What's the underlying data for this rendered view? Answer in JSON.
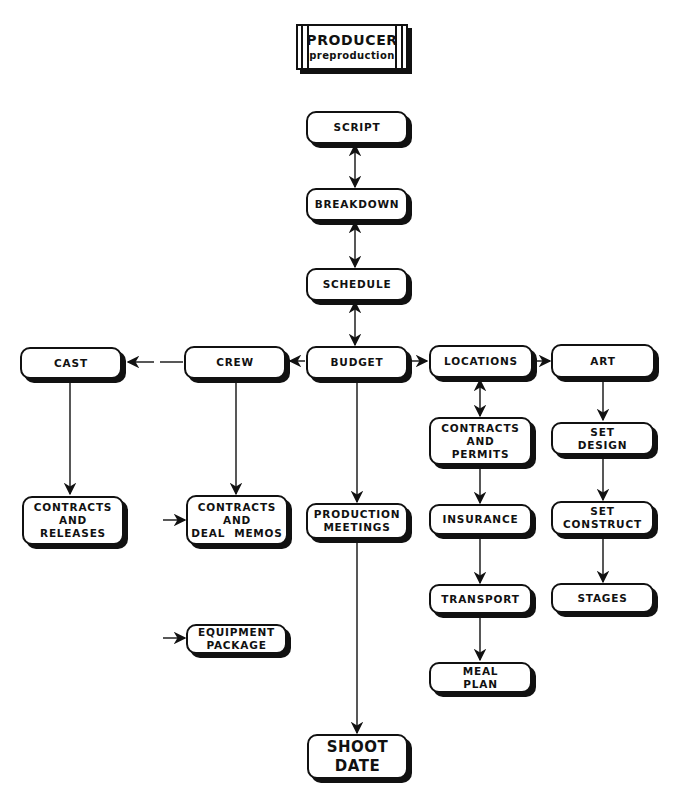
{
  "title": {
    "main": "PRODUCER",
    "sub": "preproduction"
  },
  "nodes": {
    "script": "SCRIPT",
    "breakdown": "BREAKDOWN",
    "schedule": "SCHEDULE",
    "budget": "BUDGET",
    "cast": "CAST",
    "crew": "CREW",
    "locations": "LOCATIONS",
    "art": "ART",
    "cast_contracts": [
      "CONTRACTS",
      "AND",
      "RELEASES"
    ],
    "crew_contracts": [
      "CONTRACTS",
      "AND",
      "DEAL  MEMOS"
    ],
    "equipment": [
      "EQUIPMENT",
      "PACKAGE"
    ],
    "production_meetings": [
      "PRODUCTION",
      "MEETINGS"
    ],
    "shoot_date": [
      "SHOOT",
      "DATE"
    ],
    "contracts_permits": [
      "CONTRACTS",
      "AND",
      "PERMITS"
    ],
    "insurance": "INSURANCE",
    "transport": "TRANSPORT",
    "meal_plan": [
      "MEAL",
      "PLAN"
    ],
    "set_design": [
      "SET",
      "DESIGN"
    ],
    "set_construct": [
      "SET",
      "CONSTRUCT"
    ],
    "stages": "STAGES"
  },
  "connections": [
    {
      "from": "script",
      "to": "breakdown",
      "type": "bidirectional"
    },
    {
      "from": "breakdown",
      "to": "schedule",
      "type": "bidirectional"
    },
    {
      "from": "schedule",
      "to": "budget",
      "type": "bidirectional"
    },
    {
      "from": "budget",
      "to": "crew",
      "type": "arrow"
    },
    {
      "from": "crew",
      "to": "cast",
      "type": "arrow"
    },
    {
      "from": "budget",
      "to": "locations",
      "type": "arrow"
    },
    {
      "from": "locations",
      "to": "art",
      "type": "arrow"
    },
    {
      "from": "cast",
      "to": "cast_contracts",
      "type": "arrow"
    },
    {
      "from": "crew",
      "to": "crew_contracts",
      "type": "arrow"
    },
    {
      "from": "budget",
      "to": "production_meetings",
      "type": "arrow"
    },
    {
      "from": "production_meetings",
      "to": "shoot_date",
      "type": "arrow"
    },
    {
      "from": "locations",
      "to": "contracts_permits",
      "type": "bidirectional"
    },
    {
      "from": "contracts_permits",
      "to": "insurance",
      "type": "arrow"
    },
    {
      "from": "insurance",
      "to": "transport",
      "type": "arrow"
    },
    {
      "from": "transport",
      "to": "meal_plan",
      "type": "arrow"
    },
    {
      "from": "art",
      "to": "set_design",
      "type": "arrow"
    },
    {
      "from": "set_design",
      "to": "set_construct",
      "type": "arrow"
    },
    {
      "from": "set_construct",
      "to": "stages",
      "type": "arrow"
    }
  ]
}
